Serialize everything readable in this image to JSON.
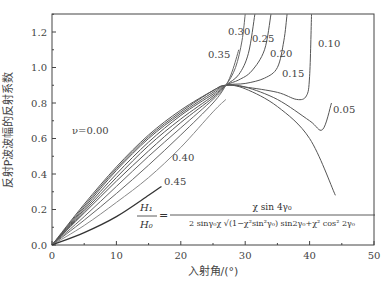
{
  "chart_data": {
    "type": "line",
    "title": "",
    "xlabel": "入射角/(°)",
    "ylabel": "反射P波波幅的反射系数",
    "xlim": [
      0,
      50
    ],
    "ylim": [
      0,
      1.3
    ],
    "x_ticks": [
      "0",
      "10",
      "20",
      "30",
      "40",
      "50"
    ],
    "y_ticks": [
      "0.0",
      "0.2",
      "0.4",
      "0.6",
      "0.8",
      "1.0",
      "1.2"
    ],
    "grid": false,
    "legend": "inline labels",
    "formula": {
      "lhs_num": "H₁",
      "lhs_den": "H₀",
      "numerator": "χ sin 4γ₀",
      "denominator": "2 sinγ₀χ √(1−χ²sin²γ₀) sin2γ₀+χ² cos² 2γ₀"
    },
    "series": [
      {
        "name": "ν=0.00",
        "label": "ν=0.00",
        "points": [
          [
            0,
            0
          ],
          [
            5,
            0.23
          ],
          [
            10,
            0.44
          ],
          [
            15,
            0.62
          ],
          [
            20,
            0.76
          ],
          [
            25,
            0.87
          ],
          [
            27,
            0.9
          ],
          [
            30,
            0.88
          ],
          [
            35,
            0.78
          ],
          [
            40,
            0.6
          ],
          [
            44,
            0.28
          ]
        ]
      },
      {
        "name": "0.05",
        "label": "0.05",
        "points": [
          [
            0,
            0
          ],
          [
            5,
            0.22
          ],
          [
            10,
            0.43
          ],
          [
            15,
            0.61
          ],
          [
            20,
            0.75
          ],
          [
            25,
            0.87
          ],
          [
            27,
            0.9
          ],
          [
            30,
            0.89
          ],
          [
            35,
            0.82
          ],
          [
            40,
            0.7
          ],
          [
            42,
            0.65
          ],
          [
            43.4,
            0.8
          ]
        ]
      },
      {
        "name": "0.10",
        "label": "0.10",
        "points": [
          [
            0,
            0
          ],
          [
            5,
            0.21
          ],
          [
            10,
            0.42
          ],
          [
            15,
            0.6
          ],
          [
            20,
            0.74
          ],
          [
            25,
            0.86
          ],
          [
            27,
            0.9
          ],
          [
            30,
            0.89
          ],
          [
            35,
            0.86
          ],
          [
            38,
            0.82
          ],
          [
            39.5,
            0.84
          ],
          [
            40,
            0.95
          ],
          [
            40.3,
            1.3
          ]
        ]
      },
      {
        "name": "0.15",
        "label": "0.15",
        "points": [
          [
            0,
            0
          ],
          [
            5,
            0.2
          ],
          [
            10,
            0.4
          ],
          [
            15,
            0.58
          ],
          [
            20,
            0.73
          ],
          [
            25,
            0.85
          ],
          [
            27,
            0.9
          ],
          [
            30,
            0.91
          ],
          [
            33,
            0.94
          ],
          [
            35,
            1.0
          ],
          [
            36,
            1.15
          ],
          [
            36.5,
            1.3
          ]
        ]
      },
      {
        "name": "0.20",
        "label": "0.20",
        "points": [
          [
            0,
            0
          ],
          [
            5,
            0.19
          ],
          [
            10,
            0.38
          ],
          [
            15,
            0.56
          ],
          [
            20,
            0.71
          ],
          [
            25,
            0.84
          ],
          [
            27,
            0.9
          ],
          [
            29,
            0.93
          ],
          [
            31,
            0.98
          ],
          [
            33,
            1.1
          ],
          [
            34,
            1.3
          ]
        ]
      },
      {
        "name": "0.25",
        "label": "0.25",
        "points": [
          [
            0,
            0
          ],
          [
            5,
            0.18
          ],
          [
            10,
            0.36
          ],
          [
            15,
            0.53
          ],
          [
            20,
            0.69
          ],
          [
            25,
            0.83
          ],
          [
            27,
            0.9
          ],
          [
            29,
            0.96
          ],
          [
            30.5,
            1.08
          ],
          [
            31.5,
            1.3
          ]
        ]
      },
      {
        "name": "0.30",
        "label": "0.30",
        "points": [
          [
            0,
            0
          ],
          [
            5,
            0.16
          ],
          [
            10,
            0.33
          ],
          [
            15,
            0.5
          ],
          [
            20,
            0.66
          ],
          [
            25,
            0.82
          ],
          [
            27,
            0.9
          ],
          [
            28.5,
            1.0
          ],
          [
            29.5,
            1.15
          ],
          [
            30,
            1.3
          ]
        ]
      },
      {
        "name": "0.35",
        "label": "0.35",
        "points": [
          [
            0,
            0
          ],
          [
            5,
            0.14
          ],
          [
            10,
            0.29
          ],
          [
            15,
            0.45
          ],
          [
            20,
            0.62
          ],
          [
            25,
            0.8
          ],
          [
            27,
            0.9
          ],
          [
            28,
            0.98
          ],
          [
            29,
            1.1
          ]
        ]
      },
      {
        "name": "0.40",
        "label": "0.40",
        "points": [
          [
            0,
            0
          ],
          [
            5,
            0.11
          ],
          [
            10,
            0.24
          ],
          [
            15,
            0.38
          ],
          [
            20,
            0.55
          ],
          [
            25,
            0.75
          ],
          [
            27,
            0.82
          ]
        ]
      },
      {
        "name": "0.45",
        "label": "0.45",
        "points": [
          [
            0,
            0
          ],
          [
            5,
            0.07
          ],
          [
            10,
            0.16
          ],
          [
            15,
            0.28
          ],
          [
            17,
            0.33
          ]
        ]
      }
    ]
  }
}
